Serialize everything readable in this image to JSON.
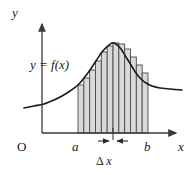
{
  "figure": {
    "type": "calculus-riemann-sum-diagram",
    "colors": {
      "axis": "#3a3a3a",
      "curve": "#1a1a1a",
      "rect_fill": "#d9d9d9",
      "rect_stroke": "#4a4a4a",
      "background": "#ffffff",
      "text": "#1a1a1a"
    }
  },
  "labels": {
    "y_axis": "y",
    "x_axis": "x",
    "origin": "O",
    "lower_limit": "a",
    "upper_limit": "b",
    "function": "y = f(x)",
    "delta_x_symbol": "Δ",
    "delta_x_var": "x"
  },
  "chart_data": {
    "type": "area",
    "title": "",
    "xlabel": "x",
    "ylabel": "y",
    "grid": false,
    "legend": "none",
    "axis": {
      "origin_px": [
        42,
        133
      ],
      "x_arrow_end_px": [
        180,
        133
      ],
      "y_arrow_end_px": [
        42,
        20
      ]
    },
    "interval": {
      "a_px": 78,
      "b_px": 148,
      "a_label": "a",
      "b_label": "b",
      "n_rectangles": 12,
      "delta_x_px": 5.833
    },
    "curve_points_px": [
      [
        24,
        108
      ],
      [
        34,
        106
      ],
      [
        44,
        104
      ],
      [
        54,
        100
      ],
      [
        62,
        96
      ],
      [
        70,
        91
      ],
      [
        78,
        85
      ],
      [
        84,
        78
      ],
      [
        90,
        70
      ],
      [
        96,
        61
      ],
      [
        102,
        52
      ],
      [
        108,
        46
      ],
      [
        112,
        43
      ],
      [
        116,
        44
      ],
      [
        121,
        49
      ],
      [
        126,
        57
      ],
      [
        131,
        65
      ],
      [
        136,
        73
      ],
      [
        141,
        79
      ],
      [
        146,
        83
      ],
      [
        152,
        86
      ],
      [
        160,
        88
      ],
      [
        170,
        89
      ],
      [
        182,
        90
      ]
    ],
    "rectangle_tops_px": [
      85,
      78,
      70,
      61,
      52,
      46,
      43,
      44,
      49,
      57,
      65,
      73
    ],
    "rectangle_baseline_px": 133,
    "delta_x_marker": {
      "tick_px": 113,
      "left_arrow_from_px": 98,
      "left_arrow_to_px": 111,
      "right_arrow_from_px": 128,
      "right_arrow_to_px": 115,
      "label": "Δ x"
    }
  }
}
